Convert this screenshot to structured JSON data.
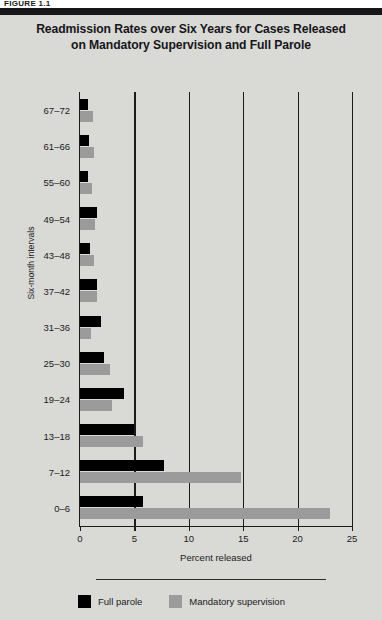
{
  "figure_label": "FIGURE 1.1",
  "chart_data": {
    "type": "bar",
    "orientation": "horizontal",
    "title": "Readmission Rates over Six Years for Cases Released on Mandatory Supervision and Full Parole",
    "title_line1": "Readmission Rates over Six Years for Cases Released",
    "title_line2": "on Mandatory Supervision and Full Parole",
    "xlabel": "Percent released",
    "ylabel": "Six-month intervals",
    "categories": [
      "0–6",
      "7–12",
      "13–18",
      "19–24",
      "25–30",
      "31–36",
      "37–42",
      "43–48",
      "49–54",
      "55–60",
      "61–66",
      "67–72"
    ],
    "series": [
      {
        "name": "Full parole",
        "color": "#000000",
        "values": [
          5.8,
          7.7,
          5.0,
          4.0,
          2.2,
          1.9,
          1.6,
          0.9,
          1.6,
          0.7,
          0.8,
          0.7
        ]
      },
      {
        "name": "Mandatory supervision",
        "color": "#9b9b9b",
        "values": [
          23.0,
          14.8,
          5.8,
          2.9,
          2.8,
          1.0,
          1.6,
          1.3,
          1.4,
          1.1,
          1.3,
          1.2
        ]
      }
    ],
    "xlim": [
      0,
      25
    ],
    "xticks": [
      0,
      5,
      10,
      15,
      20,
      25
    ],
    "xtick_labels": [
      "0",
      "5",
      "10",
      "15",
      "20",
      "25"
    ],
    "gridlines": [
      5,
      10,
      15,
      20,
      25
    ],
    "grid": true,
    "legend_position": "bottom-left",
    "legend": [
      "Full parole",
      "Mandatory supervision"
    ],
    "background_color": "#d9d9d6"
  }
}
